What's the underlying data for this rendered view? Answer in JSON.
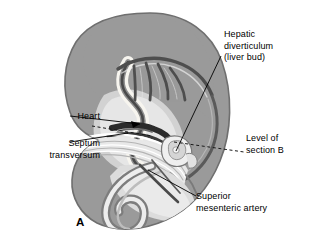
{
  "figure": {
    "panel_letter": "A",
    "background_color": "#ffffff",
    "width": 312,
    "height": 247
  },
  "palette": {
    "body_fill": "#9a9a9a",
    "body_outline": "#6f6f6f",
    "dark_structure": "#555555",
    "darkest_structure": "#2e2e2e",
    "light_tissue": "#d8d8d8",
    "pale_tissue": "#efefef",
    "cream_lumen": "#f7f5ef",
    "white": "#ffffff",
    "leader_line": "#000000",
    "text": "#000000"
  },
  "labels": [
    {
      "id": "hepatic-diverticulum",
      "lines": [
        "Hepatic",
        "diverticulum",
        "(liver bud)"
      ],
      "text": "Hepatic\ndiverticulum\n(liver bud)",
      "side": "right",
      "leader": "solid"
    },
    {
      "id": "heart",
      "lines": [
        "Heart"
      ],
      "text": "Heart",
      "side": "left",
      "leader": "solid-arrow"
    },
    {
      "id": "septum-transversum",
      "lines": [
        "Septum",
        "transversum"
      ],
      "text": "Septum\ntransversum",
      "side": "left",
      "leader": "solid"
    },
    {
      "id": "level-of-section-b",
      "lines": [
        "Level of",
        "section B"
      ],
      "text": "Level of\nsection B",
      "side": "right",
      "leader": "dashed"
    },
    {
      "id": "superior-mesenteric-artery",
      "lines": [
        "Superior",
        "mesenteric artery"
      ],
      "text": "Superior\nmesenteric artery",
      "side": "right",
      "leader": "solid"
    }
  ],
  "structures": [
    {
      "name": "embryo-body",
      "description": "C-shaped embryo silhouette, medium gray"
    },
    {
      "name": "pharyngeal-arch-arteries",
      "description": "dark curved vessels over foregut"
    },
    {
      "name": "foregut-tube",
      "description": "pale S-shaped gut tube"
    },
    {
      "name": "heart-tube",
      "description": "dark structure ventral to foregut"
    },
    {
      "name": "septum-transversum-bands",
      "description": "striped pale bands below heart"
    },
    {
      "name": "liver-bud",
      "description": "small lobulated outgrowth from foregut"
    },
    {
      "name": "midgut-loop",
      "description": "spiral coil in caudal region"
    },
    {
      "name": "section-b-plane",
      "description": "dashed plane through liver bud level"
    }
  ]
}
